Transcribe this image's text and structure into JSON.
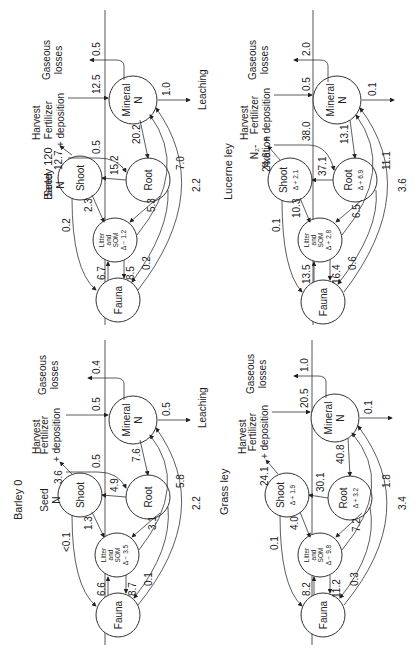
{
  "figure": {
    "orientation": "rotated-90-ccw",
    "panels": [
      {
        "id": "barley120",
        "title": "Barley 120",
        "labels": {
          "harvest": "Harvest",
          "seed": "Seed",
          "seed2": "N",
          "input1": "Fertilizer",
          "input2": "+ deposition",
          "gas1": "Gaseous",
          "gas2": "losses",
          "leaching": "Leaching",
          "mineral1": "Mineral",
          "mineral2": "N",
          "root": "Root",
          "root_delta": "",
          "shoot": "Shoot",
          "shoot_delta": "",
          "litter1": "Litter",
          "litter2": "and",
          "litter3": "SOM",
          "litter_delta": "Δ − 1.2",
          "fauna": "Fauna"
        },
        "flows": {
          "harvest": "12.7",
          "seed_to_root": "0.5",
          "fert_to_mineral": "12.5",
          "gaseous": "0.5",
          "leaching": "1.0",
          "mineral_to_root": "20.2",
          "root_to_shoot": "15.2",
          "shoot_to_litter": "2.3",
          "shoot_to_fauna": "0.2",
          "root_to_litter": "5.3",
          "root_to_fauna": "0.2",
          "litter_to_mineral": "7.0",
          "fauna_to_mineral": "2.2",
          "fauna_to_litter": "6.7",
          "litter_to_fauna": "8.5"
        }
      },
      {
        "id": "lucerne",
        "title": "Lucerne ley",
        "labels": {
          "harvest": "Harvest",
          "seed": "N₂-",
          "seed2": "fixation",
          "input1": "Fertilizer",
          "input2": "+ deposition",
          "gas1": "Gaseous",
          "gas2": "losses",
          "leaching": "",
          "mineral1": "Mineral",
          "mineral2": "N",
          "root": "Root",
          "root_delta": "Δ + 6.9",
          "shoot": "Shoot",
          "shoot_delta": "Δ + 2.1",
          "litter1": "Litter",
          "litter2": "and",
          "litter3": "SOM",
          "litter_delta": "Δ + 2.8",
          "fauna": "Fauna"
        },
        "flows": {
          "harvest": "24.6",
          "seed_to_root": "38.0",
          "fert_to_mineral": "0.5",
          "gaseous": "2.0",
          "leaching": "0.1",
          "mineral_to_root": "13.1",
          "root_to_shoot": "37.1",
          "shoot_to_litter": "10.3",
          "shoot_to_fauna": "0.1",
          "root_to_litter": "6.5",
          "root_to_fauna": "0.6",
          "litter_to_mineral": "11.1",
          "fauna_to_mineral": "3.6",
          "fauna_to_litter": "13.5",
          "litter_to_fauna": "16.4"
        }
      },
      {
        "id": "barley0",
        "title": "Barley 0",
        "labels": {
          "harvest": "Harvest",
          "seed": "Seed",
          "seed2": "N",
          "input1": "Fertilizer",
          "input2": "+ deposition",
          "gas1": "Gaseous",
          "gas2": "losses",
          "leaching": "Leaching",
          "mineral1": "Mineral",
          "mineral2": "N",
          "root": "Root",
          "root_delta": "",
          "shoot": "Shoot",
          "shoot_delta": "",
          "litter1": "Litter",
          "litter2": "and",
          "litter3": "SOM",
          "litter_delta": "Δ − 3.5",
          "fauna": "Fauna"
        },
        "flows": {
          "harvest": "3.6",
          "seed_to_root": "0.5",
          "fert_to_mineral": "0.5",
          "gaseous": "0.4",
          "leaching": "0.5",
          "mineral_to_root": "7.6",
          "root_to_shoot": "4.9",
          "shoot_to_litter": "1.3",
          "shoot_to_fauna": "<0.1",
          "root_to_litter": "3.1",
          "root_to_fauna": "0.1",
          "litter_to_mineral": "5.8",
          "fauna_to_mineral": "2.2",
          "fauna_to_litter": "6.6",
          "litter_to_fauna": "8.7"
        }
      },
      {
        "id": "grass",
        "title": "Grass ley",
        "labels": {
          "harvest": "Harvest",
          "seed": "",
          "seed2": "",
          "input1": "Fertilizer",
          "input2": "+ deposition",
          "gas1": "Gaseous",
          "gas2": "losses",
          "leaching": "",
          "mineral1": "Mineral",
          "mineral2": "N",
          "root": "Root",
          "root_delta": "Δ + 3.2",
          "shoot": "Shoot",
          "shoot_delta": "Δ + 1.9",
          "litter1": "Litter",
          "litter2": "and",
          "litter3": "SOM",
          "litter_delta": "Δ − 9.8",
          "fauna": "Fauna"
        },
        "flows": {
          "harvest": "24.1",
          "seed_to_root": "",
          "fert_to_mineral": "20.5",
          "gaseous": "1.0",
          "leaching": "0.1",
          "mineral_to_root": "40.8",
          "root_to_shoot": "30.1",
          "shoot_to_litter": "4.0",
          "shoot_to_fauna": "0.1",
          "root_to_litter": "7.2",
          "root_to_fauna": "0.3",
          "litter_to_mineral": "1.8",
          "fauna_to_mineral": "3.4",
          "fauna_to_litter": "8.2",
          "litter_to_fauna": "11.2"
        }
      }
    ]
  }
}
